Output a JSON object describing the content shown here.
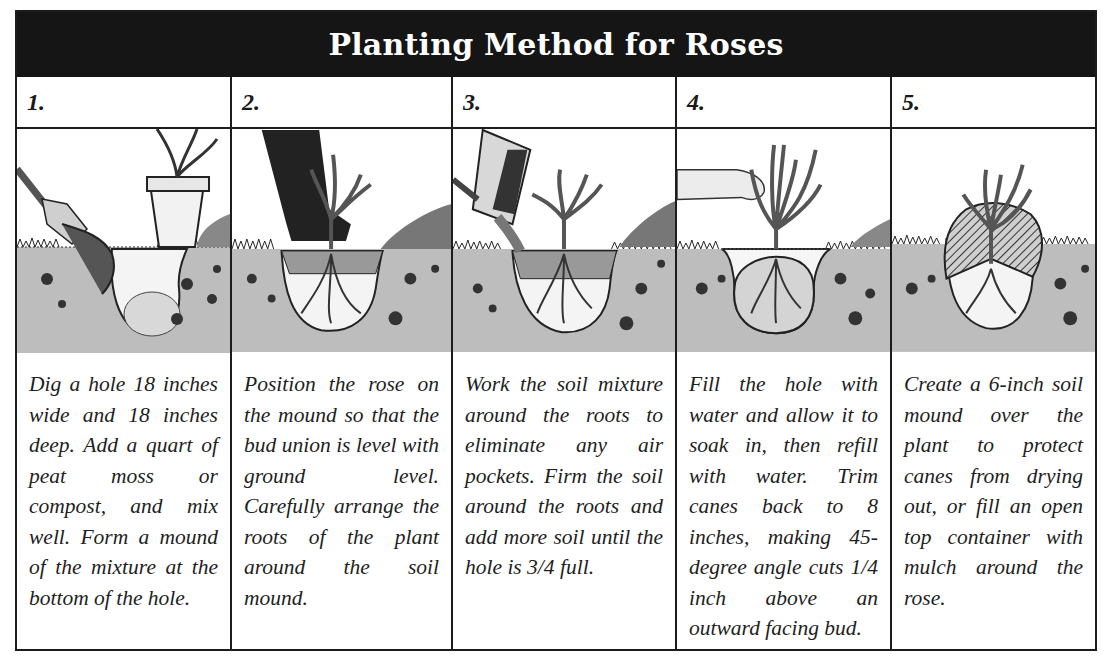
{
  "title": "Planting Method for Roses",
  "colors": {
    "title_bar_bg": "#151515",
    "title_text": "#ffffff",
    "border": "#1c1c1c",
    "soil": "#bdbdbd",
    "text": "#1e1e1e"
  },
  "steps": [
    {
      "number": "1.",
      "illustration": "shovel-adding-soil-mix-to-hole-with-potted-rose",
      "text": "Dig a hole 18 inches wide and 18 inches deep. Add a quart of peat moss or compost, and mix well. Form a mound of the mixture at the bottom of the hole."
    },
    {
      "number": "2.",
      "illustration": "rose-positioned-on-mound-with-leg",
      "text": "Position the rose on the mound so that the bud union is level with ground level. Carefully arrange the roots of the plant around the soil mound."
    },
    {
      "number": "3.",
      "illustration": "pouring-soil-mixture-around-roots",
      "text": "Work the soil mixture around the roots to eliminate any air pockets. Firm the soil around the roots and add more soil until the hole is 3/4 full."
    },
    {
      "number": "4.",
      "illustration": "hand-holding-rose-hole-filled-with-water",
      "text": "Fill the hole with water and allow it to soak in, then refill with water. Trim canes back to 8 inches, making 45-degree angle cuts 1/4 inch above an outward facing bud."
    },
    {
      "number": "5.",
      "illustration": "soil-mound-over-planted-rose",
      "text": "Create a 6-inch soil mound over the plant to protect canes from drying out, or fill an open top container with mulch around the rose."
    }
  ]
}
